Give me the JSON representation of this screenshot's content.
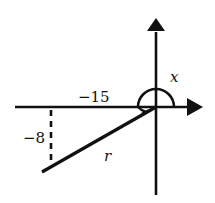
{
  "diagram": {
    "type": "trigonometry-angle-in-standard-position",
    "labels": {
      "angle": "x",
      "horizontal_leg": "−15",
      "vertical_leg": "−8",
      "radius": "r"
    },
    "values": {
      "x_coordinate": -15,
      "y_coordinate": -8
    },
    "colors": {
      "stroke": "#111111",
      "background": "#ffffff"
    }
  }
}
